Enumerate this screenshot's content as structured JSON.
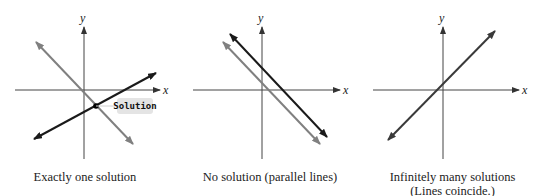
{
  "figure": {
    "panels": [
      {
        "id": "one-solution",
        "caption": "Exactly one solution",
        "axis_labels": {
          "x": "x",
          "y": "y"
        },
        "callout": "Solution",
        "lines": [
          {
            "name": "line-1",
            "color": "#808080",
            "slope_sign": "negative"
          },
          {
            "name": "line-2",
            "color": "#1a1a1a",
            "slope_sign": "positive"
          }
        ]
      },
      {
        "id": "no-solution",
        "caption": "No solution (parallel lines)",
        "axis_labels": {
          "x": "x",
          "y": "y"
        },
        "lines": [
          {
            "name": "line-1",
            "color": "#1a1a1a",
            "slope_sign": "negative"
          },
          {
            "name": "line-2",
            "color": "#808080",
            "slope_sign": "negative"
          }
        ]
      },
      {
        "id": "infinite-solutions",
        "caption_line1": "Infinitely many solutions",
        "caption_line2": "(Lines coincide.)",
        "axis_labels": {
          "x": "x",
          "y": "y"
        },
        "lines": [
          {
            "name": "coincident-line",
            "color": "#3a3a3a",
            "slope_sign": "positive"
          }
        ]
      }
    ],
    "colors": {
      "axis": "#444444",
      "dark_line": "#1a1a1a",
      "gray_line": "#808080",
      "callout_bg": "#e4e4e4"
    }
  }
}
